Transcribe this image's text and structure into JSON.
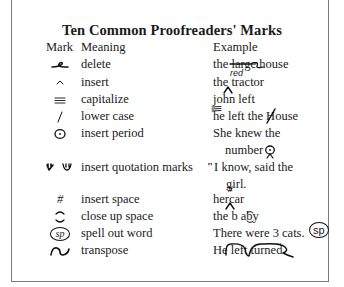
{
  "title": "Ten Common Proofreaders' Marks",
  "headers": {
    "mark": "Mark",
    "meaning": "Meaning",
    "example": "Example"
  },
  "rows": [
    {
      "mark_icon": "delete-mark-icon",
      "meaning": "delete",
      "example": {
        "pre": "the ",
        "struck": "large",
        "post": " house",
        "annotation": "red"
      }
    },
    {
      "mark_icon": "caret-icon",
      "meaning": "insert",
      "example": {
        "pre": "the tractor"
      }
    },
    {
      "mark_icon": "triple-underline-icon",
      "meaning": "capitalize",
      "example": {
        "pre": "john left"
      }
    },
    {
      "mark_icon": "slash-icon",
      "meaning": "lower case",
      "example": {
        "pre": "he left the ",
        "struck": "H",
        "post": "ouse"
      }
    },
    {
      "mark_icon": "circled-dot-icon",
      "meaning": "insert period",
      "example": {
        "line1": "She knew the",
        "line2": "number"
      }
    },
    {
      "mark_icon": "quotation-marks-icon",
      "meaning": "insert quotation marks",
      "example": {
        "line1": "I know, said the",
        "line2": "girl."
      }
    },
    {
      "mark_icon": "hash-icon",
      "meaning": "insert space",
      "example": {
        "pre": "hercar"
      }
    },
    {
      "mark_icon": "close-up-icon",
      "meaning": "close up space",
      "example": {
        "pre": "the b aby"
      }
    },
    {
      "mark_icon": "circled-sp-icon",
      "mark_text": "sp",
      "meaning": "spell out word",
      "example": {
        "pre": "There were 3 cats.",
        "annotation": "sp"
      }
    },
    {
      "mark_icon": "transpose-icon",
      "meaning": "transpose",
      "example": {
        "pre": "He left turned"
      }
    }
  ]
}
